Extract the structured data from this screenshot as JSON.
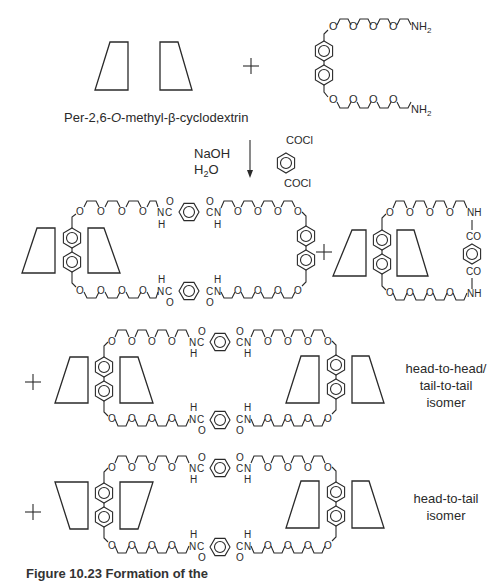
{
  "figure": {
    "reactant_label": "Per-2,6-O-methyl-β-cyclodextrin",
    "reactant_label_parts": {
      "prefix": "Per-2,6-",
      "italic": "O",
      "suffix": "-methyl-β-cyclodextrin"
    },
    "amine_end_group": "NH",
    "amine_subscript": "2",
    "ether_oxygen": "O",
    "plus_sign": "+",
    "reagents": {
      "base": "NaOH",
      "solvent_main": "H",
      "solvent_sub": "2",
      "solvent_tail": "O"
    },
    "acid_chloride_group": "COCl",
    "amide": {
      "N": "N",
      "C": "C",
      "O": "O",
      "H": "H",
      "NH": "NH",
      "CO": "CO"
    },
    "isomer_labels": {
      "hh_tt": [
        "head-to-head/",
        "tail-to-tail",
        "isomer"
      ],
      "ht": [
        "head-to-tail",
        "isomer"
      ]
    },
    "caption": "Figure 10.23   Formation of the"
  }
}
